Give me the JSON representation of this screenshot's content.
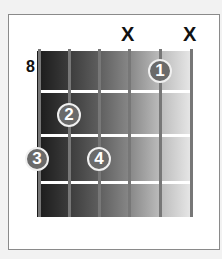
{
  "diagram": {
    "type": "guitar-chord-chart",
    "starting_fret_label": "8",
    "strings": 6,
    "frets_shown": 4,
    "muted_strings": [
      {
        "string_index": 4,
        "label": "X"
      },
      {
        "string_index": 6,
        "label": "X"
      }
    ],
    "fingers": [
      {
        "label": "1",
        "string_index": 5,
        "fret": 1
      },
      {
        "label": "2",
        "string_index": 2,
        "fret": 2
      },
      {
        "label": "3",
        "string_index": 1,
        "fret": 3
      },
      {
        "label": "4",
        "string_index": 3,
        "fret": 3
      }
    ]
  }
}
